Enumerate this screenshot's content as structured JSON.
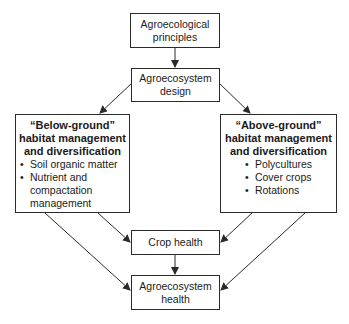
{
  "diagram": {
    "nodes": {
      "principles": {
        "line1": "Agroecological",
        "line2": "principles"
      },
      "design": {
        "line1": "Agroecosystem",
        "line2": "design"
      },
      "below": {
        "title1": "“Below-ground”",
        "title2": "habitat management",
        "title3": "and diversification",
        "items": [
          "Soil organic matter",
          "Nutrient and",
          "compactation",
          "management"
        ]
      },
      "above": {
        "title1": "“Above-ground”",
        "title2": "habitat management",
        "title3": "and diversification",
        "items": [
          "Polycultures",
          "Cover crops",
          "Rotations"
        ]
      },
      "crop_health": {
        "label": "Crop health"
      },
      "agro_health": {
        "line1": "Agroecosystem",
        "line2": "health"
      }
    },
    "edges": [
      [
        "principles",
        "design"
      ],
      [
        "design",
        "below"
      ],
      [
        "design",
        "above"
      ],
      [
        "below",
        "crop_health"
      ],
      [
        "below",
        "agro_health"
      ],
      [
        "above",
        "crop_health"
      ],
      [
        "above",
        "agro_health"
      ],
      [
        "crop_health",
        "agro_health"
      ]
    ],
    "colors": {
      "line": "#2a2a2a",
      "background": "#ffffff"
    }
  }
}
